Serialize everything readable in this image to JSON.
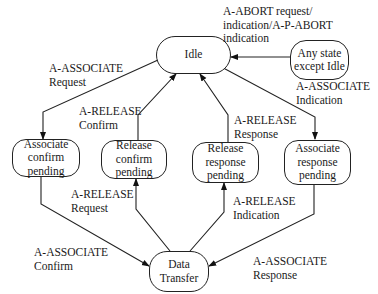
{
  "diagram": {
    "title": "",
    "nodes": {
      "idle": "Idle",
      "any_state": "Any state\nexcept Idle",
      "assoc_confirm_pending": "Associate\nconfirm\npending",
      "release_confirm_pending": "Release\nconfirm\npending",
      "release_response_pending": "Release\nresponse\npending",
      "assoc_response_pending": "Associate\nresponse\npending",
      "data_transfer": "Data\nTransfer"
    },
    "edges": [
      {
        "from": "any_state",
        "to": "idle",
        "label": "A-ABORT request/\nindication/A-P-ABORT\nindication"
      },
      {
        "from": "idle",
        "to": "assoc_confirm_pending",
        "label": "A-ASSOCIATE\nRequest"
      },
      {
        "from": "release_confirm_pending",
        "to": "idle",
        "label": "A-RELEASE\nConfirm"
      },
      {
        "from": "release_response_pending",
        "to": "idle",
        "label": "A-RELEASE\nResponse"
      },
      {
        "from": "idle",
        "to": "assoc_response_pending",
        "label": "A-ASSOCIATE\nIndication"
      },
      {
        "from": "data_transfer",
        "to": "release_confirm_pending",
        "label": "A-RELEASE\nRequest"
      },
      {
        "from": "data_transfer",
        "to": "release_response_pending",
        "label": "A-RELEASE\nIndication"
      },
      {
        "from": "assoc_confirm_pending",
        "to": "data_transfer",
        "label": "A-ASSOCIATE\nConfirm"
      },
      {
        "from": "assoc_response_pending",
        "to": "data_transfer",
        "label": "A-ASSOCIATE\nResponse"
      }
    ]
  }
}
